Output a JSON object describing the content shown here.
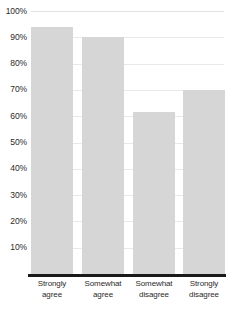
{
  "chart_data": {
    "type": "bar",
    "title": "",
    "subtitle": "",
    "xlabel": "",
    "ylabel": "",
    "categories": [
      "Strongly agree",
      "Somewhat agree",
      "Somewhat disagree",
      "Strongly disagree"
    ],
    "category_lines": [
      [
        "Strongly",
        "agree"
      ],
      [
        "Somewhat",
        "agree"
      ],
      [
        "Somewhat",
        "disagree"
      ],
      [
        "Strongly",
        "disagree"
      ]
    ],
    "values": [
      94,
      90,
      61.5,
      70
    ],
    "value_labels": [
      "94%",
      "90%",
      "61.5%",
      "70%"
    ],
    "ylim": [
      0,
      100
    ],
    "y_ticks": [
      100,
      90,
      80,
      70,
      60,
      50,
      40,
      30,
      20,
      10
    ],
    "y_tick_labels": [
      "100%",
      "90%",
      "80%",
      "70%",
      "60%",
      "50%",
      "40%",
      "30%",
      "20%",
      "10%"
    ],
    "grid": true,
    "legend": false,
    "legend_position": "none",
    "colors": {
      "bar_fill": "#d6d6d6",
      "gridline": "#e9e9e9",
      "axis_line": "#1a1a1a",
      "tick_label": "#2b2b2b",
      "background": "#ffffff"
    }
  }
}
